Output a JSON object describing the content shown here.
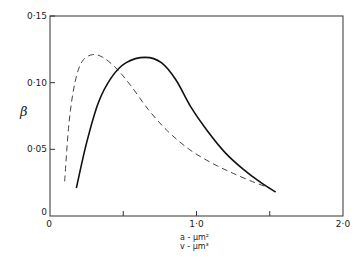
{
  "chart_data": {
    "type": "line",
    "title": "",
    "xlabel": [
      "a - µm²",
      "v - µm³"
    ],
    "ylabel": "β",
    "xlim": [
      0,
      2.0
    ],
    "ylim": [
      0,
      0.15
    ],
    "x_ticks": [
      0,
      0.5,
      1.0,
      1.5,
      2.0
    ],
    "x_tick_labels": [
      "0",
      "",
      "1·0",
      "",
      "2·0"
    ],
    "y_ticks": [
      0,
      0.05,
      0.1,
      0.15
    ],
    "y_tick_labels": [
      "0",
      "0·05",
      "0·10",
      "0·15"
    ],
    "grid": false,
    "legend": null,
    "series": [
      {
        "name": "dashed",
        "style": "dashed",
        "x": [
          0.1,
          0.13,
          0.17,
          0.22,
          0.29,
          0.36,
          0.45,
          0.55,
          0.67,
          0.8,
          0.95,
          1.1,
          1.25,
          1.4,
          1.5
        ],
        "y": [
          0.026,
          0.07,
          0.1,
          0.116,
          0.121,
          0.119,
          0.111,
          0.098,
          0.08,
          0.064,
          0.05,
          0.04,
          0.032,
          0.025,
          0.021
        ]
      },
      {
        "name": "solid",
        "style": "solid",
        "x": [
          0.18,
          0.25,
          0.33,
          0.42,
          0.52,
          0.65,
          0.76,
          0.86,
          0.96,
          1.08,
          1.2,
          1.32,
          1.44,
          1.54
        ],
        "y": [
          0.021,
          0.055,
          0.085,
          0.104,
          0.115,
          0.119,
          0.115,
          0.102,
          0.082,
          0.063,
          0.047,
          0.035,
          0.025,
          0.018
        ]
      }
    ]
  }
}
